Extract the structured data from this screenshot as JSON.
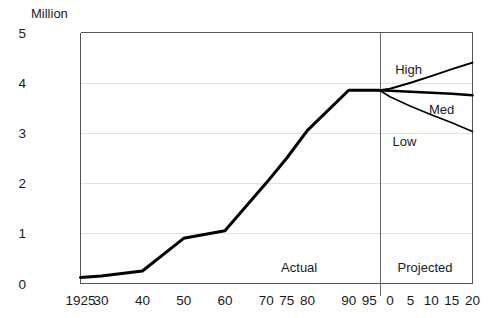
{
  "chart_data": {
    "type": "line",
    "title": "",
    "ylabel": "Million",
    "xlabel": "",
    "ylim": [
      0,
      5
    ],
    "yticks": [
      0,
      1,
      2,
      3,
      4,
      5
    ],
    "ytick_labels": [
      "0",
      "1",
      "2",
      "3",
      "4",
      "5"
    ],
    "grid": true,
    "grid_axis": "y",
    "legend": "inline-labels",
    "xtick_labels": [
      "1925",
      "30",
      "40",
      "50",
      "60",
      "70",
      "75",
      "80",
      "90",
      "95",
      "0",
      "5",
      "10",
      "15",
      "20"
    ],
    "x_positions": [
      1925,
      1930,
      1940,
      1950,
      1960,
      1970,
      1975,
      1980,
      1990,
      1995,
      2000,
      2005,
      2010,
      2015,
      2020
    ],
    "divider_x": 1997.5,
    "annotations": [
      {
        "name": "actual",
        "text": "Actual",
        "x": 1978,
        "y": 0.33
      },
      {
        "name": "projected",
        "text": "Projected",
        "x": 2008.5,
        "y": 0.33
      },
      {
        "name": "low",
        "text": "Low",
        "x": 2003.5,
        "y": 2.83
      }
    ],
    "series": [
      {
        "name": "Actual",
        "label": "",
        "style": "solid-thick",
        "x": [
          1925,
          1930,
          1940,
          1950,
          1960,
          1970,
          1975,
          1980,
          1990,
          1995,
          1997.5
        ],
        "values": [
          0.12,
          0.15,
          0.25,
          0.9,
          1.05,
          2.0,
          2.5,
          3.05,
          3.85,
          3.85,
          3.85
        ]
      },
      {
        "name": "High",
        "label": "High",
        "style": "solid",
        "label_x": 2004.5,
        "label_y": 4.27,
        "x": [
          1997.5,
          2000,
          2005,
          2010,
          2015,
          2020
        ],
        "values": [
          3.85,
          3.88,
          4.0,
          4.13,
          4.27,
          4.4
        ]
      },
      {
        "name": "Med",
        "label": "Med",
        "style": "solid",
        "label_x": 2012.5,
        "label_y": 3.47,
        "x": [
          1997.5,
          2000,
          2005,
          2010,
          2015,
          2020
        ],
        "values": [
          3.85,
          3.84,
          3.82,
          3.8,
          3.78,
          3.75
        ]
      },
      {
        "name": "Low",
        "label": "",
        "style": "solid",
        "x": [
          1997.5,
          2000,
          2005,
          2010,
          2015,
          2020
        ],
        "values": [
          3.85,
          3.72,
          3.53,
          3.36,
          3.2,
          3.03
        ]
      }
    ]
  }
}
